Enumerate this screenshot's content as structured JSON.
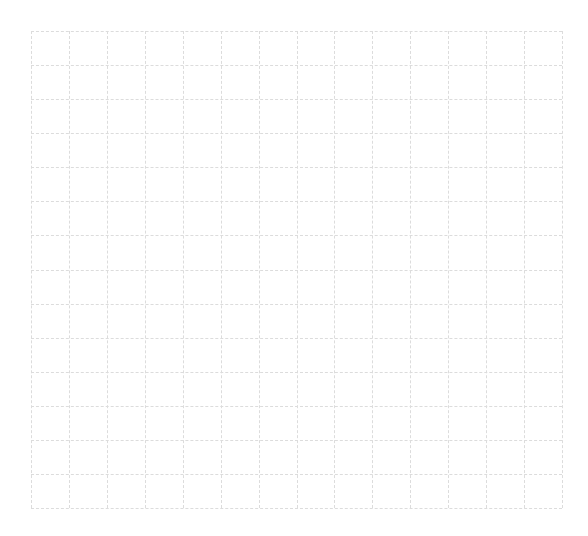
{
  "figure": {
    "kind": "blank-dashed-grid",
    "background_color": "#ffffff",
    "width_px": 588,
    "height_px": 536,
    "title": "",
    "x_axis_label": "",
    "y_axis_label": ""
  },
  "grid": {
    "left_px": 31,
    "top_px": 31,
    "width_px": 531,
    "height_px": 477,
    "columns": 14,
    "rows": 14,
    "vertical_line_count": 15,
    "horizontal_line_count": 15,
    "cell_width_px": 37.93,
    "cell_height_px": 34.07,
    "line_color": "#dcdcdc",
    "line_style": "dashed",
    "line_width_px": 1,
    "dash_pattern": "3 2"
  },
  "chart_data": {
    "type": "scatter",
    "title": "",
    "subtitle": "",
    "xlabel": "",
    "ylabel": "",
    "grid": true,
    "grid_style": "dashed",
    "grid_color": "#dcdcdc",
    "legend": false,
    "legend_position": "none",
    "x_tick_labels": [],
    "y_tick_labels": [],
    "xlim": [
      0,
      14
    ],
    "ylim": [
      0,
      14
    ],
    "x_major_ticks": 14,
    "y_major_ticks": 14,
    "series": [],
    "x": [],
    "values": [],
    "annotations": [],
    "note": "Empty plot canvas: dashed graph-paper grid of 14 by 14 cells with no plotted data, no tick labels, no axis titles, and no legend."
  }
}
